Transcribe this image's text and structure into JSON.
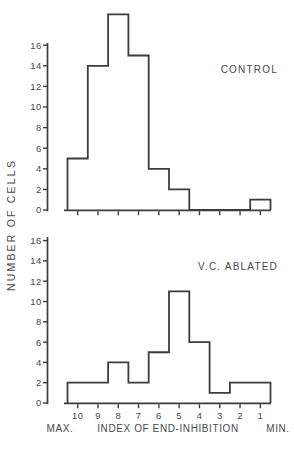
{
  "figure": {
    "bg_color": "#fefefe",
    "line_color": "#3d3d3d",
    "text_color": "#4a4a4a"
  },
  "y_axis_label": "NUMBER OF CELLS",
  "x_axis": {
    "label": "INDEX OF END-INHIBITION",
    "left_label": "MAX.",
    "right_label": "MIN.",
    "tick_labels": [
      "10",
      "9",
      "8",
      "7",
      "6",
      "5",
      "4",
      "3",
      "2",
      "1"
    ]
  },
  "chart_data": [
    {
      "type": "bar",
      "style": "step-histogram-outline",
      "title": "CONTROL",
      "categories": [
        10,
        9,
        8,
        7,
        6,
        5,
        4,
        3,
        2,
        1
      ],
      "values": [
        5,
        14,
        19,
        15,
        4,
        2,
        0,
        0,
        0,
        1
      ],
      "xlabel": "INDEX OF END-INHIBITION",
      "ylabel": "NUMBER OF CELLS",
      "ylim": [
        0,
        16
      ],
      "y_ticks": [
        0,
        2,
        4,
        6,
        8,
        10,
        12,
        14,
        16
      ],
      "grid": "off",
      "x_direction": "max-to-min",
      "peak_exceeds_axis": true
    },
    {
      "type": "bar",
      "style": "step-histogram-outline",
      "title": "V.C. ABLATED",
      "categories": [
        10,
        9,
        8,
        7,
        6,
        5,
        4,
        3,
        2,
        1
      ],
      "values": [
        2,
        2,
        4,
        2,
        5,
        11,
        6,
        1,
        2,
        2
      ],
      "xlabel": "INDEX OF END-INHIBITION",
      "ylabel": "NUMBER OF CELLS",
      "ylim": [
        0,
        16
      ],
      "y_ticks": [
        0,
        2,
        4,
        6,
        8,
        10,
        12,
        14,
        16
      ],
      "grid": "off",
      "x_direction": "max-to-min",
      "peak_exceeds_axis": false
    }
  ]
}
